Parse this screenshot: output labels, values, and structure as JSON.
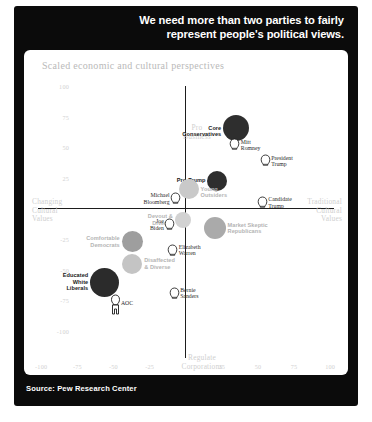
{
  "headline": {
    "line1": "We need more than two parties to fairly",
    "line2": "represent people's political views."
  },
  "source": "Source: Pew Research Center",
  "chart_data": {
    "type": "scatter",
    "title": "Scaled economic and cultural perspectives",
    "xlabel_left": "Regulate\nCorporations",
    "axis_captions": {
      "top": "Pro\nBusiness",
      "bottom": "Regulate\nCorporations",
      "left": "Changing\nCultural\nValues",
      "right": "Traditional\nCultural\nValues"
    },
    "xlim": [
      -100,
      100
    ],
    "ylim": [
      -100,
      100
    ],
    "grid": false,
    "xticks": [
      -100,
      -75,
      -50,
      -25,
      25,
      50,
      75,
      100
    ],
    "yticks": [
      100,
      75,
      50,
      25,
      -25,
      -50,
      -75,
      -100
    ],
    "groups": [
      {
        "name": "Core Conservatives",
        "x": 35,
        "y": 66,
        "size": 26,
        "color": "#2e2e2e",
        "label_style": "dark",
        "label_align": "right"
      },
      {
        "name": "Pro-Trump",
        "x": 22,
        "y": 23,
        "size": 20,
        "color": "#2e2e2e",
        "label_style": "dark",
        "label_align": "right"
      },
      {
        "name": "Young Outsiders",
        "x": 2,
        "y": 16,
        "size": 20,
        "color": "#c9c9c9",
        "label_style": "light",
        "label_align": "left"
      },
      {
        "name": "Market Skeptic\nRepublicans",
        "x": 20,
        "y": -16,
        "size": 22,
        "color": "#aaaaaa",
        "label_style": "light",
        "label_align": "left"
      },
      {
        "name": "Devout &\nDiverse",
        "x": -2,
        "y": -9,
        "size": 16,
        "color": "#d2d2d2",
        "label_style": "light",
        "label_align": "right"
      },
      {
        "name": "Comfortable\nDemocrats",
        "x": -37,
        "y": -27,
        "size": 21,
        "color": "#9e9e9e",
        "label_style": "light",
        "label_align": "right"
      },
      {
        "name": "Disaffected\n& Diverse",
        "x": -37,
        "y": -45,
        "size": 20,
        "color": "#c4c4c4",
        "label_style": "light",
        "label_align": "left"
      },
      {
        "name": "Educated\nWhite\nLiberals",
        "x": -56,
        "y": -60,
        "size": 29,
        "color": "#2b2b2b",
        "label_style": "dark",
        "label_align": "right"
      }
    ],
    "people": [
      {
        "name": "Mitt\nRomney",
        "x": 34,
        "y": 53,
        "label_align": "right"
      },
      {
        "name": "President\nTrump",
        "x": 55,
        "y": 40,
        "label_align": "right"
      },
      {
        "name": "Candidate\nTrump",
        "x": 53,
        "y": 6,
        "label_align": "right"
      },
      {
        "name": "Michael\nBloomberg",
        "x": -7,
        "y": 9,
        "label_align": "left"
      },
      {
        "name": "Joe\nBiden",
        "x": -11,
        "y": -12,
        "label_align": "left"
      },
      {
        "name": "Elizabeth\nWarren",
        "x": -9,
        "y": -33,
        "label_align": "right"
      },
      {
        "name": "Bernie\nSanders",
        "x": -8,
        "y": -68,
        "label_align": "right"
      },
      {
        "name": "AOC",
        "x": -49,
        "y": -76,
        "label_align": "right"
      }
    ]
  }
}
